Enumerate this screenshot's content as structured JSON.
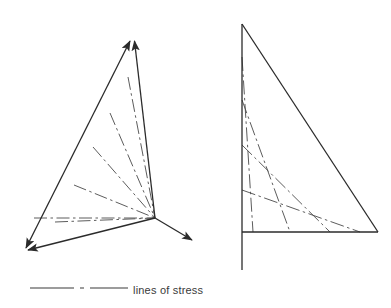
{
  "figure": {
    "background_color": "#ffffff",
    "stroke_color": "#2b2b2b",
    "stress_line_color": "#4a4a4a",
    "outline_width": 1.3,
    "stress_line_width": 0.9
  },
  "legend": {
    "label": "lines of stress",
    "sample_pattern": "dash-dot",
    "sample_x1": 30,
    "sample_x2": 128,
    "sample_y": 288,
    "label_x": 133,
    "label_y": 291
  },
  "left_figure": {
    "name": "radiating-stress-fan",
    "description": "triangular element with arrowed edges and a fan of stress lines converging at a node",
    "convergence_point": {
      "x": 155,
      "y": 218
    },
    "vertices": {
      "apex": {
        "x": 133,
        "y": 34
      },
      "bottom_left": {
        "x": 22,
        "y": 255
      },
      "right_tip": {
        "x": 197,
        "y": 243
      }
    },
    "outline_edges": [
      {
        "name": "apex-to-bottom-left",
        "x1": 133,
        "y1": 34,
        "x2": 22,
        "y2": 255,
        "arrow_start": true,
        "arrow_end": true
      },
      {
        "name": "apex-to-node",
        "x1": 133,
        "y1": 34,
        "x2": 155,
        "y2": 218,
        "arrow_start": true,
        "arrow_end": false
      },
      {
        "name": "bottom-left-to-node",
        "x1": 22,
        "y1": 255,
        "x2": 155,
        "y2": 218,
        "arrow_start": true,
        "arrow_end": false
      },
      {
        "name": "node-to-right-tip",
        "x1": 155,
        "y1": 218,
        "x2": 197,
        "y2": 243,
        "arrow_start": false,
        "arrow_end": true
      }
    ],
    "stress_lines": [
      {
        "name": "fan-line-1",
        "x1": 128,
        "y1": 77,
        "x2": 155,
        "y2": 218
      },
      {
        "name": "fan-line-2",
        "x1": 110,
        "y1": 113,
        "x2": 155,
        "y2": 218
      },
      {
        "name": "fan-line-3",
        "x1": 93,
        "y1": 147,
        "x2": 155,
        "y2": 218
      },
      {
        "name": "fan-line-4",
        "x1": 74,
        "y1": 185,
        "x2": 155,
        "y2": 218
      },
      {
        "name": "fan-line-5",
        "x1": 55,
        "y1": 222,
        "x2": 155,
        "y2": 218
      },
      {
        "name": "fan-line-6",
        "x1": 34,
        "y1": 218,
        "x2": 155,
        "y2": 218
      }
    ],
    "stress_line_count": 6
  },
  "right_figure": {
    "name": "parallel-stress-triangle",
    "description": "right triangle with vertical support line and parallel stress lines",
    "vertices": {
      "apex": {
        "x": 242,
        "y": 24
      },
      "bottom_left": {
        "x": 242,
        "y": 232
      },
      "bottom_right": {
        "x": 378,
        "y": 232
      }
    },
    "vertical_line": {
      "x": 242,
      "y_top": 24,
      "y_bottom": 270
    },
    "outline_edges": [
      {
        "name": "hypotenuse",
        "x1": 242,
        "y1": 24,
        "x2": 378,
        "y2": 232
      },
      {
        "name": "baseline",
        "x1": 242,
        "y1": 232,
        "x2": 378,
        "y2": 232
      },
      {
        "name": "vertical-support",
        "x1": 242,
        "y1": 24,
        "x2": 242,
        "y2": 270
      }
    ],
    "stress_lines": [
      {
        "name": "parallel-line-1",
        "x1": 242,
        "y1": 57,
        "x2": 253,
        "y2": 232
      },
      {
        "name": "parallel-line-2",
        "x1": 242,
        "y1": 100,
        "x2": 290,
        "y2": 232
      },
      {
        "name": "parallel-line-3",
        "x1": 242,
        "y1": 145,
        "x2": 330,
        "y2": 232
      },
      {
        "name": "parallel-line-4",
        "x1": 242,
        "y1": 190,
        "x2": 360,
        "y2": 232
      }
    ],
    "stress_line_count": 4
  }
}
